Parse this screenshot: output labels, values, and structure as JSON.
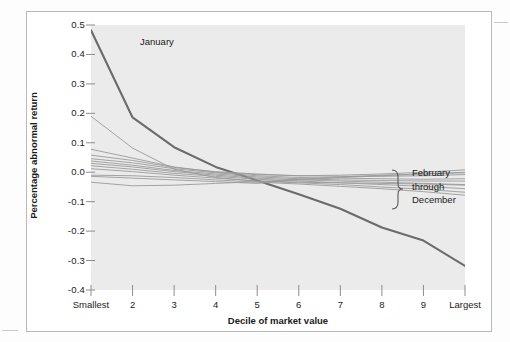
{
  "figure": {
    "background_color": "#fdfdfd",
    "frame_color": "#b9b9b9",
    "plot_background_color": "#ebebeb"
  },
  "labels": {
    "january": "January",
    "legend_line1": "February",
    "legend_line2": "through",
    "legend_line3": "December"
  },
  "chart_data": {
    "type": "line",
    "title": "",
    "xlabel": "Decile of market value",
    "ylabel": "Percentage abnormal return",
    "grid": false,
    "legend_position": "right-inline-brace",
    "annotations": [
      {
        "text": "January",
        "x": 1.6,
        "y": 0.44
      },
      {
        "text": "February through December",
        "x": 10.6,
        "y": -0.035
      }
    ],
    "categories": [
      "Smallest",
      "2",
      "3",
      "4",
      "5",
      "6",
      "7",
      "8",
      "9",
      "Largest"
    ],
    "x": [
      1,
      2,
      3,
      4,
      5,
      6,
      7,
      8,
      9,
      10
    ],
    "xlim": [
      1,
      10
    ],
    "ylim": [
      -0.4,
      0.5
    ],
    "yticks": [
      0.5,
      0.4,
      0.3,
      0.2,
      0.1,
      0.0,
      -0.1,
      -0.2,
      -0.3,
      -0.4
    ],
    "ytick_labels": [
      "0.5",
      "0.4",
      "0.3",
      "0.2",
      "0.1",
      "0.0",
      "-0.1",
      "-0.2",
      "-0.3",
      "-0.4"
    ],
    "series": [
      {
        "name": "January",
        "color": "#6b6b6b",
        "width": 2.1,
        "values": [
          0.482,
          0.186,
          0.085,
          0.018,
          -0.028,
          -0.075,
          -0.124,
          -0.188,
          -0.232,
          -0.318
        ]
      },
      {
        "name": "February",
        "color": "#9a9a9a",
        "width": 0.9,
        "values": [
          0.19,
          0.082,
          0.01,
          -0.018,
          -0.03,
          -0.034,
          -0.036,
          -0.038,
          -0.04,
          -0.044
        ]
      },
      {
        "name": "March",
        "color": "#9a9a9a",
        "width": 0.9,
        "values": [
          0.078,
          0.048,
          0.018,
          0.0,
          -0.008,
          -0.012,
          -0.01,
          -0.006,
          0.0,
          0.008
        ]
      },
      {
        "name": "April",
        "color": "#9a9a9a",
        "width": 0.9,
        "values": [
          0.058,
          0.04,
          0.016,
          0.002,
          -0.006,
          -0.012,
          -0.014,
          -0.014,
          -0.012,
          -0.008
        ]
      },
      {
        "name": "May",
        "color": "#9a9a9a",
        "width": 0.9,
        "values": [
          0.046,
          0.032,
          0.012,
          -0.002,
          -0.012,
          -0.018,
          -0.02,
          -0.022,
          -0.024,
          -0.022
        ]
      },
      {
        "name": "June",
        "color": "#9a9a9a",
        "width": 0.9,
        "values": [
          0.038,
          0.024,
          0.006,
          -0.006,
          -0.016,
          -0.022,
          -0.026,
          -0.028,
          -0.03,
          -0.03
        ]
      },
      {
        "name": "July",
        "color": "#9a9a9a",
        "width": 0.9,
        "values": [
          0.03,
          0.018,
          0.002,
          -0.01,
          -0.02,
          -0.026,
          -0.03,
          -0.034,
          -0.038,
          -0.042
        ]
      },
      {
        "name": "August",
        "color": "#9a9a9a",
        "width": 0.9,
        "values": [
          0.022,
          0.01,
          -0.004,
          -0.014,
          -0.024,
          -0.03,
          -0.036,
          -0.042,
          -0.048,
          -0.056
        ]
      },
      {
        "name": "September",
        "color": "#9a9a9a",
        "width": 0.9,
        "values": [
          0.012,
          0.002,
          -0.01,
          -0.02,
          -0.03,
          -0.036,
          -0.042,
          -0.05,
          -0.058,
          -0.068
        ]
      },
      {
        "name": "October",
        "color": "#9a9a9a",
        "width": 0.9,
        "values": [
          -0.01,
          -0.012,
          -0.018,
          -0.026,
          -0.034,
          -0.04,
          -0.048,
          -0.056,
          -0.066,
          -0.078
        ]
      },
      {
        "name": "November",
        "color": "#9a9a9a",
        "width": 0.9,
        "values": [
          -0.014,
          -0.02,
          -0.026,
          -0.032,
          -0.038,
          -0.026,
          -0.018,
          -0.012,
          -0.006,
          0.0
        ]
      },
      {
        "name": "December",
        "color": "#9a9a9a",
        "width": 0.9,
        "values": [
          -0.034,
          -0.046,
          -0.044,
          -0.038,
          -0.032,
          -0.024,
          -0.016,
          -0.01,
          -0.006,
          -0.002
        ]
      }
    ]
  }
}
